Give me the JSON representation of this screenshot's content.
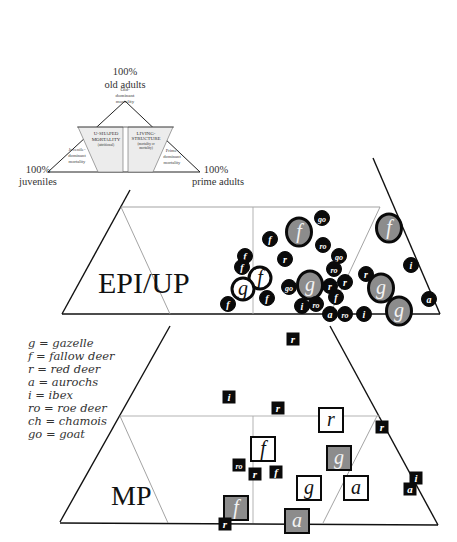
{
  "key_diagram": {
    "apex_top": {
      "line1": "100%",
      "line2": "old adults"
    },
    "apex_left": {
      "line1": "100%",
      "line2": "juveniles"
    },
    "apex_right": {
      "line1": "100%",
      "line2": "prime adults"
    },
    "regions": {
      "old": [
        "Old-",
        "dominant",
        "mortality"
      ],
      "juvenile": [
        "Juvenile-",
        "dominant",
        "mortality"
      ],
      "u_shaped": [
        "U-SHAPED",
        "MORTALITY",
        "(attritional)"
      ],
      "living": [
        "LIVING-",
        "STRUCTURE",
        "(mortality or",
        "mortality)"
      ],
      "prime": [
        "Prime-",
        "dominant",
        "mortality"
      ]
    }
  },
  "panels": {
    "epi_up": {
      "label": "EPI/UP"
    },
    "mp": {
      "label": "MP"
    }
  },
  "legend": [
    "g = gazelle",
    "f = fallow deer",
    "r = red deer",
    "a = aurochs",
    "i = ibex",
    "ro = roe deer",
    "ch = chamois",
    "go = goat"
  ],
  "colors": {
    "line": "#111111",
    "thin_line": "#9a9a9a",
    "marker_black": "#0a0a0a",
    "marker_gray": "#8c8c8c",
    "marker_white": "#ffffff"
  },
  "epi_up_markers": [
    {
      "s": "go",
      "x": 322,
      "y": 218,
      "size": "small",
      "fill": "black"
    },
    {
      "s": "f",
      "x": 299,
      "y": 232,
      "size": "large",
      "fill": "gray"
    },
    {
      "s": "f",
      "x": 270,
      "y": 239,
      "size": "small",
      "fill": "black"
    },
    {
      "s": "ro",
      "x": 323,
      "y": 245,
      "size": "small",
      "fill": "black"
    },
    {
      "s": "go",
      "x": 339,
      "y": 256,
      "size": "small",
      "fill": "black"
    },
    {
      "s": "r",
      "x": 285,
      "y": 259,
      "size": "small",
      "fill": "black"
    },
    {
      "s": "f",
      "x": 245,
      "y": 256,
      "size": "small",
      "fill": "black"
    },
    {
      "s": "f",
      "x": 242,
      "y": 267,
      "size": "small",
      "fill": "black"
    },
    {
      "s": "f",
      "x": 260,
      "y": 278,
      "size": "medium",
      "fill": "white"
    },
    {
      "s": "g",
      "x": 243,
      "y": 289,
      "size": "medium",
      "fill": "white"
    },
    {
      "s": "ro",
      "x": 334,
      "y": 269,
      "size": "small",
      "fill": "black"
    },
    {
      "s": "go",
      "x": 289,
      "y": 287,
      "size": "small",
      "fill": "black"
    },
    {
      "s": "g",
      "x": 310,
      "y": 285,
      "size": "large",
      "fill": "gray"
    },
    {
      "s": "r",
      "x": 330,
      "y": 286,
      "size": "small",
      "fill": "black"
    },
    {
      "s": "r",
      "x": 345,
      "y": 282,
      "size": "small",
      "fill": "black"
    },
    {
      "s": "f",
      "x": 336,
      "y": 297,
      "size": "small",
      "fill": "black"
    },
    {
      "s": "f",
      "x": 267,
      "y": 298,
      "size": "small",
      "fill": "black"
    },
    {
      "s": "f",
      "x": 228,
      "y": 304,
      "size": "small",
      "fill": "black"
    },
    {
      "s": "i",
      "x": 302,
      "y": 306,
      "size": "small",
      "fill": "black"
    },
    {
      "s": "ro",
      "x": 316,
      "y": 304,
      "size": "small",
      "fill": "black"
    },
    {
      "s": "a",
      "x": 330,
      "y": 314,
      "size": "small",
      "fill": "black"
    },
    {
      "s": "ro",
      "x": 345,
      "y": 314,
      "size": "small",
      "fill": "black"
    },
    {
      "s": "i",
      "x": 364,
      "y": 314,
      "size": "small",
      "fill": "black"
    },
    {
      "s": "r",
      "x": 366,
      "y": 274,
      "size": "small",
      "fill": "black"
    },
    {
      "s": "g",
      "x": 381,
      "y": 288,
      "size": "large",
      "fill": "gray"
    },
    {
      "s": "g",
      "x": 399,
      "y": 311,
      "size": "large",
      "fill": "gray"
    },
    {
      "s": "f",
      "x": 389,
      "y": 228,
      "size": "large",
      "fill": "gray"
    },
    {
      "s": "i",
      "x": 411,
      "y": 265,
      "size": "small",
      "fill": "black"
    },
    {
      "s": "a",
      "x": 429,
      "y": 299,
      "size": "small",
      "fill": "black"
    }
  ],
  "mp_markers": [
    {
      "s": "r",
      "x": 293,
      "y": 339,
      "size": "small",
      "fill": "black"
    },
    {
      "s": "i",
      "x": 229,
      "y": 397,
      "size": "small",
      "fill": "black"
    },
    {
      "s": "r",
      "x": 278,
      "y": 408,
      "size": "small",
      "fill": "black"
    },
    {
      "s": "r",
      "x": 331,
      "y": 420,
      "size": "large",
      "fill": "white"
    },
    {
      "s": "r",
      "x": 382,
      "y": 427,
      "size": "small",
      "fill": "black"
    },
    {
      "s": "f",
      "x": 263,
      "y": 449,
      "size": "large",
      "fill": "white"
    },
    {
      "s": "ro",
      "x": 239,
      "y": 465,
      "size": "small",
      "fill": "black"
    },
    {
      "s": "r",
      "x": 255,
      "y": 474,
      "size": "small",
      "fill": "black"
    },
    {
      "s": "f",
      "x": 276,
      "y": 472,
      "size": "small",
      "fill": "black"
    },
    {
      "s": "g",
      "x": 339,
      "y": 458,
      "size": "large",
      "fill": "gray"
    },
    {
      "s": "g",
      "x": 309,
      "y": 488,
      "size": "large",
      "fill": "white"
    },
    {
      "s": "a",
      "x": 356,
      "y": 488,
      "size": "large",
      "fill": "white"
    },
    {
      "s": "i",
      "x": 416,
      "y": 478,
      "size": "small",
      "fill": "black"
    },
    {
      "s": "a",
      "x": 410,
      "y": 489,
      "size": "small",
      "fill": "black"
    },
    {
      "s": "f",
      "x": 236,
      "y": 508,
      "size": "large",
      "fill": "gray"
    },
    {
      "s": "r",
      "x": 225,
      "y": 524,
      "size": "small",
      "fill": "black"
    },
    {
      "s": "a",
      "x": 297,
      "y": 521,
      "size": "large",
      "fill": "gray"
    }
  ]
}
